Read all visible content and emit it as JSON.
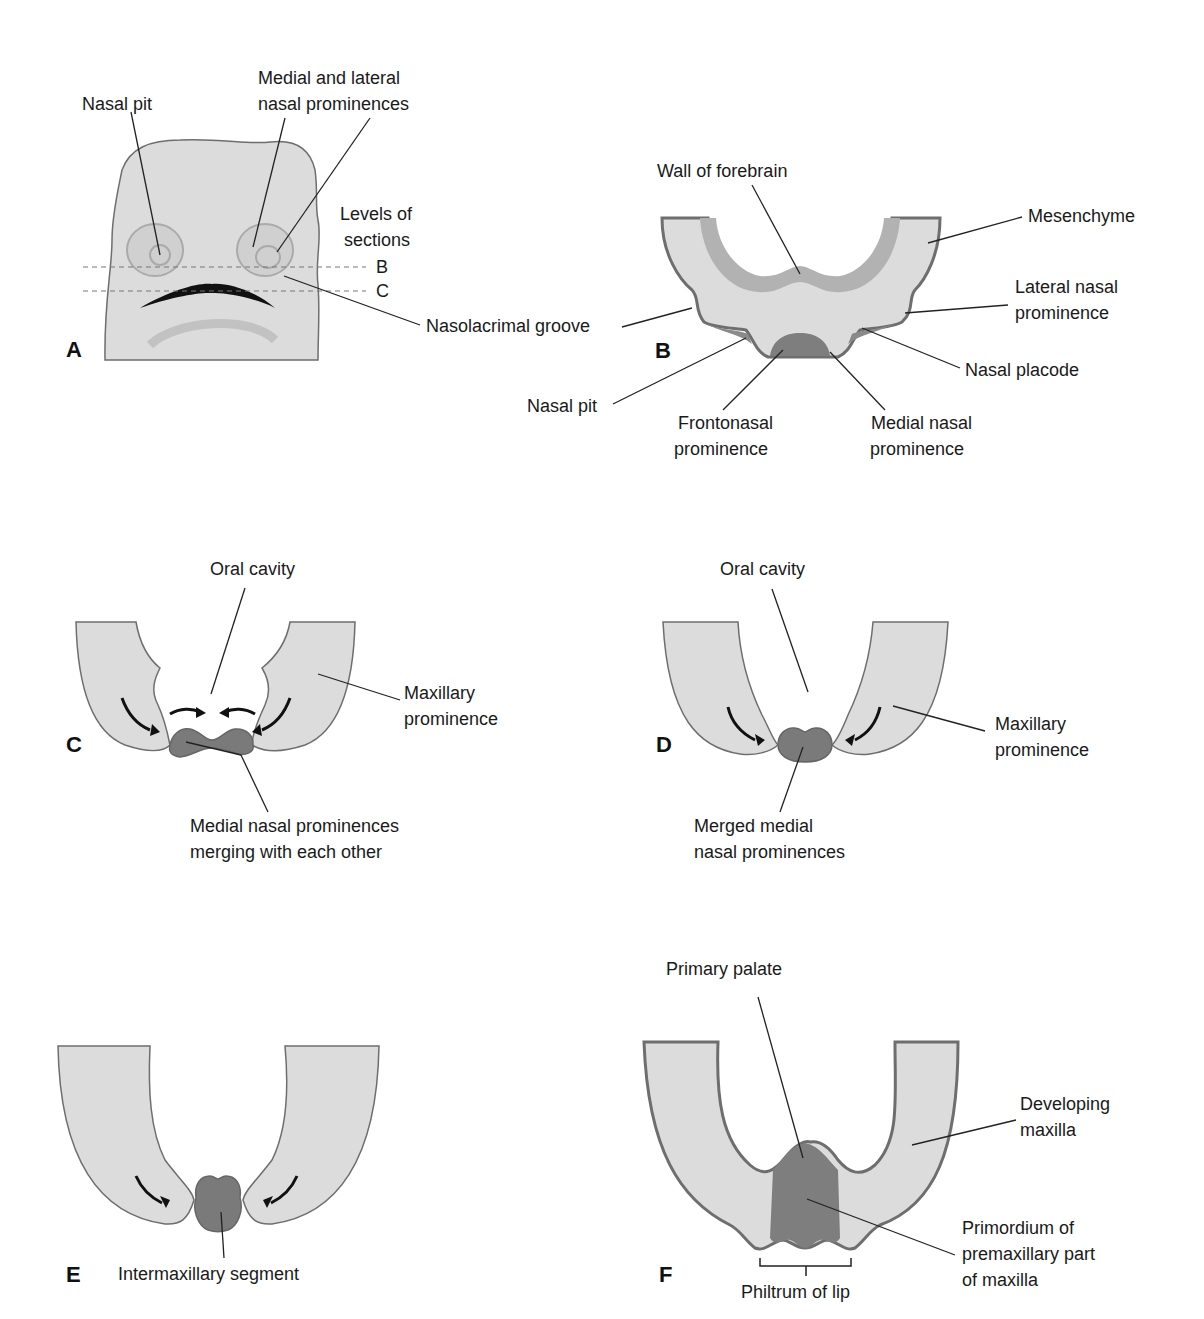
{
  "panels": {
    "A": {
      "letter": "A",
      "labels": {
        "nasal_pit": "Nasal pit",
        "medial_lateral_1": "Medial and lateral",
        "medial_lateral_2": "nasal prominences",
        "levels_1": "Levels of",
        "levels_2": "sections",
        "level_b": "B",
        "level_c": "C",
        "nasolacrimal": "Nasolacrimal groove"
      }
    },
    "B": {
      "letter": "B",
      "labels": {
        "wall_forebrain": "Wall of forebrain",
        "mesenchyme": "Mesenchyme",
        "lateral_1": "Lateral nasal",
        "lateral_2": "prominence",
        "nasal_placode": "Nasal placode",
        "nasal_pit": "Nasal pit",
        "frontonasal_1": "Frontonasal",
        "frontonasal_2": "prominence",
        "medial_1": "Medial nasal",
        "medial_2": "prominence"
      }
    },
    "C": {
      "letter": "C",
      "labels": {
        "oral_cavity": "Oral cavity",
        "maxillary_1": "Maxillary",
        "maxillary_2": "prominence",
        "merging_1": "Medial nasal prominences",
        "merging_2": "merging with each other"
      }
    },
    "D": {
      "letter": "D",
      "labels": {
        "oral_cavity": "Oral cavity",
        "maxillary_1": "Maxillary",
        "maxillary_2": "prominence",
        "merged_1": "Merged medial",
        "merged_2": "nasal prominences"
      }
    },
    "E": {
      "letter": "E",
      "labels": {
        "intermaxillary": "Intermaxillary segment"
      }
    },
    "F": {
      "letter": "F",
      "labels": {
        "primary_palate": "Primary palate",
        "developing_1": "Developing",
        "developing_2": "maxilla",
        "primordium_1": "Primordium of",
        "primordium_2": "premaxillary part",
        "primordium_3": "of maxilla",
        "philtrum": "Philtrum of lip"
      }
    }
  },
  "colors": {
    "tissue": "#dcdcdc",
    "outline": "#6e6e6e",
    "dark_tissue": "#7a7a7a",
    "ink": "#1a1a1a"
  }
}
